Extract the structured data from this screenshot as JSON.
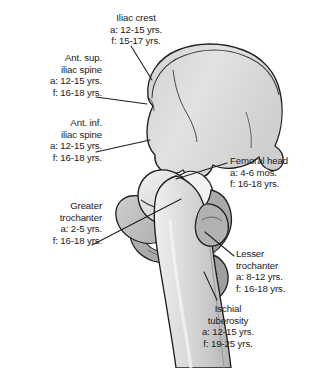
{
  "figure": {
    "colors": {
      "background": "#ffffff",
      "bone_light": "#dedede",
      "bone_mid": "#bdbdbd",
      "bone_dark": "#a2a2a2",
      "bone_shadow": "#8e8e8e",
      "outline": "#1e1e1e",
      "text": "#1a1a1a",
      "leader_line": "#1e1e1e"
    }
  },
  "labels": [
    {
      "id": "iliac-crest",
      "name": "Iliac crest",
      "appearance": "a: 12-15 yrs.",
      "fusion": "f: 15-17 yrs.",
      "align": "center"
    },
    {
      "id": "ant-sup-iliac-spine",
      "name_line1": "Ant. sup.",
      "name_line2": "iliac spine",
      "appearance": "a: 12-15 yrs.",
      "fusion": "f: 16-18 yrs.",
      "align": "right"
    },
    {
      "id": "ant-inf-iliac-spine",
      "name_line1": "Ant. inf.",
      "name_line2": "iliac spine",
      "appearance": "a: 12-15 yrs.",
      "fusion": "f: 16-18 yrs.",
      "align": "right"
    },
    {
      "id": "greater-trochanter",
      "name_line1": "Greater",
      "name_line2": "trochanter",
      "appearance": "a: 2-5 yrs.",
      "fusion": "f: 16-18 yrs.",
      "align": "right"
    },
    {
      "id": "femoral-head",
      "name": "Femoral head",
      "appearance": "a: 4-6 mos.",
      "fusion": "f: 16-18 yrs.",
      "align": "left"
    },
    {
      "id": "lesser-trochanter",
      "name_line1": "Lesser",
      "name_line2": "trochanter",
      "appearance": "a: 8-12 yrs.",
      "fusion": "f: 16-18 yrs.",
      "align": "left"
    },
    {
      "id": "ischial-tuberosity",
      "name_line1": "Ischial",
      "name_line2": "tuberosity",
      "appearance": "a: 12-15 yrs.",
      "fusion": "f: 19-25 yrs.",
      "align": "center"
    }
  ]
}
